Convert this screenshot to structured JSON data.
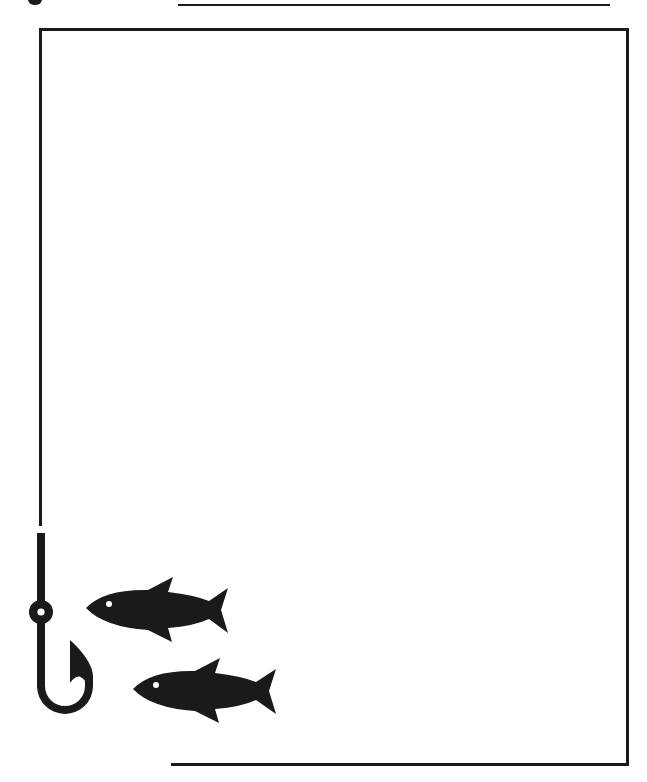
{
  "page": {
    "ink_color": "#1a1a1a",
    "background_color": "#ffffff"
  },
  "decorations": {
    "icons": [
      "fish-hook-icon",
      "fish-icon",
      "fish-icon"
    ],
    "top_partial_mark": "cropped-dot"
  },
  "frame": {
    "content": ""
  }
}
